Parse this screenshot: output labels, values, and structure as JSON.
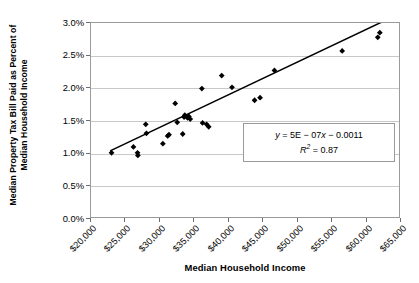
{
  "chart_data": {
    "type": "scatter",
    "title": "",
    "xlabel": "Median Household Income",
    "ylabel": "Median Property Tax Bill Paid as Percent of Median Household Income",
    "ylabel_line1": "Median Property Tax Bill Paid as Percent of",
    "ylabel_line2": "Median Household Income",
    "xlim": [
      20000,
      65000
    ],
    "ylim": [
      0.0,
      3.0
    ],
    "xtick_labels": [
      "$20,000",
      "$25,000",
      "$30,000",
      "$35,000",
      "$40,000",
      "$45,000",
      "$50,000",
      "$55,000",
      "$60,000",
      "$65,000"
    ],
    "xtick_values": [
      20000,
      25000,
      30000,
      35000,
      40000,
      45000,
      50000,
      55000,
      60000,
      65000
    ],
    "ytick_labels": [
      "0.0%",
      "0.5%",
      "1.0%",
      "1.5%",
      "2.0%",
      "2.5%",
      "3.0%"
    ],
    "ytick_values": [
      0.0,
      0.5,
      1.0,
      1.5,
      2.0,
      2.5,
      3.0
    ],
    "grid": "horizontal",
    "legend": "none",
    "marker": "diamond",
    "marker_color": "#000000",
    "trendline": {
      "type": "linear",
      "color": "#000000",
      "slope": 5e-07,
      "intercept": -0.0011,
      "x_start": 22800,
      "x_end": 62400
    },
    "annotations": {
      "equation": "y = 5E − 07x − 0.0011",
      "equation_y": "y",
      "equation_body": " = 5E − 07",
      "equation_x": "x",
      "equation_tail": " − 0.0011",
      "r_squared_label": "R",
      "r_squared_sup": "2",
      "r_squared_value": " = 0.87",
      "r_squared": "R² = 0.87"
    },
    "points": [
      {
        "x": 23000,
        "y": 1.0
      },
      {
        "x": 26200,
        "y": 1.09
      },
      {
        "x": 26800,
        "y": 1.0
      },
      {
        "x": 26850,
        "y": 0.96
      },
      {
        "x": 28000,
        "y": 1.44
      },
      {
        "x": 28100,
        "y": 1.3
      },
      {
        "x": 30500,
        "y": 1.14
      },
      {
        "x": 31200,
        "y": 1.26
      },
      {
        "x": 31400,
        "y": 1.28
      },
      {
        "x": 32300,
        "y": 1.76
      },
      {
        "x": 32600,
        "y": 1.47
      },
      {
        "x": 33400,
        "y": 1.29
      },
      {
        "x": 33600,
        "y": 1.55
      },
      {
        "x": 33700,
        "y": 1.58
      },
      {
        "x": 34100,
        "y": 1.54
      },
      {
        "x": 34300,
        "y": 1.56
      },
      {
        "x": 34500,
        "y": 1.52
      },
      {
        "x": 36200,
        "y": 1.99
      },
      {
        "x": 36300,
        "y": 1.46
      },
      {
        "x": 36900,
        "y": 1.44
      },
      {
        "x": 37200,
        "y": 1.4
      },
      {
        "x": 39100,
        "y": 2.19
      },
      {
        "x": 40600,
        "y": 2.01
      },
      {
        "x": 43900,
        "y": 1.81
      },
      {
        "x": 44700,
        "y": 1.85
      },
      {
        "x": 46800,
        "y": 2.27
      },
      {
        "x": 56700,
        "y": 2.57
      },
      {
        "x": 61900,
        "y": 2.78
      },
      {
        "x": 62200,
        "y": 2.85
      }
    ]
  }
}
